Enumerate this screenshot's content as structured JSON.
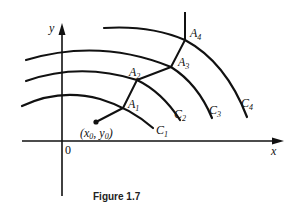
{
  "figure": {
    "caption": "Figure 1.7",
    "axes": {
      "x_label": "x",
      "y_label": "y",
      "origin_label": "0"
    },
    "start_point": {
      "label": "(x₀, y₀)",
      "label_parts": [
        "(",
        "x",
        "0",
        ", ",
        "y",
        "0",
        ")"
      ]
    },
    "curves": [
      {
        "name": "C",
        "sub": "1"
      },
      {
        "name": "C",
        "sub": "2"
      },
      {
        "name": "C",
        "sub": "3"
      },
      {
        "name": "C",
        "sub": "4"
      }
    ],
    "points": [
      {
        "name": "A",
        "sub": "1"
      },
      {
        "name": "A",
        "sub": "2"
      },
      {
        "name": "A",
        "sub": "3"
      },
      {
        "name": "A",
        "sub": "4"
      }
    ],
    "colors": {
      "ink": "#111111",
      "background": "#ffffff"
    }
  }
}
